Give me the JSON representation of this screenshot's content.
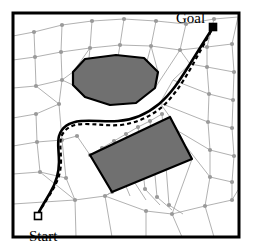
{
  "figure": {
    "width": 256,
    "height": 250,
    "background_color": "#ffffff"
  },
  "colors": {
    "border": "#000000",
    "mesh_line": "#a8a8a8",
    "mesh_node": "#9a9a9a",
    "obstacle_fill": "#707070",
    "obstacle_stroke": "#000000",
    "path_solid": "#000000",
    "path_dashed": "#000000",
    "marker_fill_goal": "#000000",
    "marker_fill_start": "#ffffff",
    "marker_stroke": "#000000",
    "label_text": "#000000"
  },
  "labels": {
    "goal": "Goal",
    "start": "Start"
  },
  "markers": {
    "goal": {
      "x": 213,
      "y": 27,
      "size": 7,
      "filled": true
    },
    "start": {
      "x": 38,
      "y": 216,
      "size": 7,
      "filled": false
    }
  },
  "border": {
    "x": 13,
    "y": 13,
    "width": 226,
    "height": 224,
    "stroke_width": 3
  },
  "obstacles": [
    {
      "name": "octagon-obstacle",
      "points": "73,72 85,59 116,55 144,58 158,72 155,88 136,103 110,105 85,97 73,85"
    },
    {
      "name": "rectangle-obstacle",
      "points": "90,155 170,117 192,159 112,192"
    }
  ],
  "paths": {
    "solid": "M 38,214 C 42,206 46,200 50,193 C 56,183 59,173 59,162 C 59,151 57,143 59,136 C 62,126 70,122 81,121 C 94,120 105,122 118,121 C 133,120 147,114 159,104 C 171,94 180,80 190,64 C 198,51 205,40 212,29",
    "dashed": "M 38,214 C 43,205 48,198 52,191 C 58,181 61,172 61,161 C 61,150 59,142 62,135 C 66,127 74,124 84,124 C 97,124 108,126 121,125 C 136,123 150,117 162,107 C 174,96 183,82 192,66 C 199,53 206,41 212,29",
    "solid_width": 2.6,
    "dashed_width": 2.2,
    "dash_pattern": "4,3"
  },
  "mesh": {
    "description": "cell decomposition of free space",
    "edges": [
      "13,36 34,32",
      "34,32 62,25",
      "62,25 92,21",
      "92,21 124,19",
      "124,19 156,21",
      "156,21 186,24",
      "186,24 214,19",
      "214,19 238,17",
      "13,60 35,57",
      "35,57 61,52",
      "35,57 34,32",
      "61,52 62,25",
      "61,52 90,48",
      "90,48 92,21",
      "90,48 120,45",
      "120,45 124,19",
      "120,45 151,46",
      "151,46 156,21",
      "151,46 180,50",
      "180,50 186,24",
      "180,50 207,47",
      "207,47 214,19",
      "207,47 232,44",
      "232,44 238,17",
      "13,88 36,86",
      "36,86 35,57",
      "36,86 62,80",
      "62,80 61,52",
      "62,80 73,72",
      "73,72 90,48",
      "62,80 59,104",
      "59,104 36,86",
      "13,118 36,114",
      "36,114 59,104",
      "36,114 37,142",
      "37,142 13,146",
      "37,142 62,140",
      "62,140 59,104",
      "62,140 77,136",
      "13,174 40,172",
      "40,172 37,142",
      "40,172 66,178",
      "66,178 62,140",
      "66,178 75,200",
      "75,200 40,172",
      "75,200 13,204",
      "75,200 76,237",
      "105,196 75,200",
      "105,196 112,192",
      "105,196 112,237",
      "146,211 105,196",
      "146,211 146,237",
      "146,211 172,214",
      "172,214 192,159",
      "172,214 182,237",
      "172,214 205,206",
      "205,206 232,200",
      "232,200 238,190",
      "205,206 214,237",
      "232,44 234,72",
      "234,72 207,67",
      "207,67 207,47",
      "234,72 233,100",
      "233,100 209,94",
      "209,94 207,67",
      "233,100 232,128",
      "232,128 208,122",
      "208,122 209,94",
      "232,128 234,156",
      "234,156 210,150",
      "210,150 208,122",
      "234,156 232,182",
      "232,182 210,177",
      "210,177 210,150",
      "232,182 232,200",
      "210,177 205,206",
      "190,64 180,50",
      "190,64 207,67",
      "173,80 190,64",
      "173,80 209,94",
      "160,103 173,80",
      "160,103 208,122",
      "170,117 160,103",
      "178,131 170,117",
      "178,131 210,150",
      "185,145 178,131",
      "185,145 210,177",
      "192,159 185,145",
      "158,72 151,46",
      "155,88 180,50",
      "136,103 151,46",
      "110,105 120,45",
      "85,97 90,48",
      "73,85 62,80",
      "90,155 77,136",
      "102,148 90,155",
      "114,141 102,148",
      "126,134 114,141",
      "138,127 126,134",
      "150,121 138,127",
      "162,114 150,121",
      "102,148 108,163",
      "114,141 120,172",
      "126,134 133,180",
      "138,127 145,189",
      "150,121 157,197",
      "162,114 169,205",
      "108,163 112,192",
      "120,172 130,196",
      "133,180 146,200",
      "145,189 160,205",
      "157,197 172,210",
      "169,205 183,214",
      "112,192 105,196"
    ],
    "nodes": [
      "34,32",
      "62,25",
      "92,21",
      "124,19",
      "156,21",
      "186,24",
      "214,19",
      "35,57",
      "61,52",
      "90,48",
      "120,45",
      "151,46",
      "180,50",
      "207,47",
      "232,44",
      "36,86",
      "62,80",
      "59,104",
      "36,114",
      "37,142",
      "62,140",
      "77,136",
      "40,172",
      "66,178",
      "75,200",
      "105,196",
      "146,211",
      "172,214",
      "205,206",
      "232,200",
      "234,72",
      "207,67",
      "233,100",
      "209,94",
      "232,128",
      "208,122",
      "234,156",
      "210,150",
      "232,182",
      "210,177",
      "90,155",
      "102,148",
      "114,141",
      "126,134",
      "138,127",
      "150,121",
      "162,114",
      "108,163",
      "120,172",
      "133,180",
      "145,189",
      "157,197",
      "169,205",
      "112,192"
    ],
    "node_radius": 2.1,
    "line_width": 0.9
  }
}
